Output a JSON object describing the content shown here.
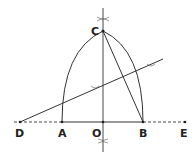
{
  "diagram": {
    "points": {
      "D": {
        "label": "D",
        "x": 20,
        "y": 122
      },
      "A": {
        "label": "A",
        "x": 62,
        "y": 122
      },
      "O": {
        "label": "O",
        "x": 103,
        "y": 122
      },
      "B": {
        "label": "B",
        "x": 143,
        "y": 122
      },
      "E": {
        "label": "E",
        "x": 185,
        "y": 122
      },
      "C": {
        "label": "C",
        "x": 103,
        "y": 31
      }
    },
    "colors": {
      "line": "#333333",
      "label": "#222222",
      "background": "#ffffff"
    }
  }
}
